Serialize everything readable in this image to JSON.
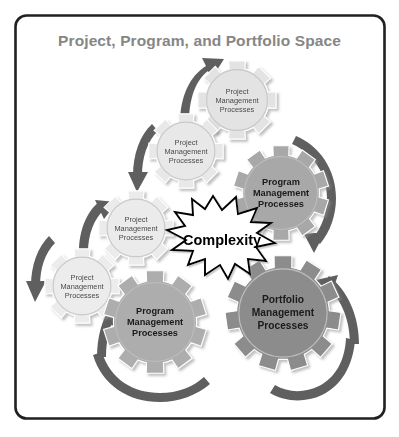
{
  "figure": {
    "title": "Project, Program, and Portfolio Space",
    "border_color": "#231f20",
    "background_color": "#ffffff",
    "title_color": "#868686"
  },
  "center_burst": {
    "label": "Complexity",
    "fill": "#ffffff",
    "stroke": "#000000"
  },
  "gears": [
    {
      "id": "project-top",
      "line1": "Project",
      "line2": "Management",
      "line3": "Processes",
      "tier": "project",
      "fill": "#e3e3e3",
      "cx": 237,
      "cy": 100,
      "r": 40,
      "teeth": 8,
      "size_class": "small"
    },
    {
      "id": "project-upper-left",
      "line1": "Project",
      "line2": "Management",
      "line3": "Processes",
      "tier": "project",
      "fill": "#e8e8e8",
      "cx": 186,
      "cy": 151,
      "r": 38,
      "teeth": 8,
      "size_class": "small"
    },
    {
      "id": "project-mid-left",
      "line1": "Project",
      "line2": "Management",
      "line3": "Processes",
      "tier": "project",
      "fill": "#ebebeb",
      "cx": 136,
      "cy": 228,
      "r": 38,
      "teeth": 8,
      "size_class": "small"
    },
    {
      "id": "project-lower-left",
      "line1": "Project",
      "line2": "Management",
      "line3": "Processes",
      "tier": "project",
      "fill": "#ececec",
      "cx": 82,
      "cy": 286,
      "r": 38,
      "teeth": 8,
      "size_class": "small"
    },
    {
      "id": "program-right",
      "line1": "Program",
      "line2": "Management",
      "line3": "Processes",
      "tier": "program",
      "fill": "#a8a8a8",
      "cx": 281,
      "cy": 193,
      "r": 48,
      "teeth": 10,
      "size_class": "medium"
    },
    {
      "id": "program-bottom",
      "line1": "Program",
      "line2": "Management",
      "line3": "Processes",
      "tier": "program",
      "fill": "#adadad",
      "cx": 155,
      "cy": 322,
      "r": 52,
      "teeth": 10,
      "size_class": "medium"
    },
    {
      "id": "portfolio",
      "line1": "Portfolio",
      "line2": "Management",
      "line3": "Processes",
      "tier": "portfolio",
      "fill": "#8c8c8c",
      "cx": 283,
      "cy": 313,
      "r": 58,
      "teeth": 11,
      "size_class": "large"
    }
  ],
  "arrows": [
    {
      "id": "arrow-to-top-project",
      "color": "#5f5f5f"
    },
    {
      "id": "arrow-down-to-upper-left-project",
      "color": "#5f5f5f"
    },
    {
      "id": "arrow-to-mid-left-project",
      "color": "#5f5f5f"
    },
    {
      "id": "arrow-down-to-lower-left-project",
      "color": "#5f5f5f"
    },
    {
      "id": "arrow-up-to-program-bottom",
      "color": "#5f5f5f"
    },
    {
      "id": "arrow-under-program-bottom",
      "color": "#5f5f5f"
    },
    {
      "id": "arrow-down-right-from-program",
      "color": "#5f5f5f"
    },
    {
      "id": "arrow-up-into-portfolio",
      "color": "#5f5f5f"
    },
    {
      "id": "arrow-under-portfolio",
      "color": "#5f5f5f"
    }
  ]
}
